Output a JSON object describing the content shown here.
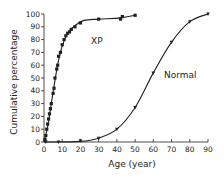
{
  "chart_data": {
    "type": "line",
    "title": "",
    "xlabel": "Age (year)",
    "ylabel": "Cumulative percentage",
    "xlim": [
      0,
      90
    ],
    "ylim": [
      0,
      100
    ],
    "xticks": [
      0,
      10,
      20,
      30,
      40,
      50,
      60,
      70,
      80,
      90
    ],
    "yticks": [
      0,
      10,
      20,
      30,
      40,
      50,
      60,
      70,
      80,
      90,
      100
    ],
    "grid": false,
    "legend": "inline labels",
    "series": [
      {
        "name": "XP",
        "marker": "square",
        "x": [
          0.5,
          1,
          1.5,
          2,
          2.5,
          3,
          3.5,
          4,
          5,
          5.5,
          6,
          7,
          7.5,
          8,
          9,
          10,
          11,
          12,
          13,
          14,
          15,
          17,
          20,
          30,
          42,
          43,
          50
        ],
        "y": [
          2,
          5,
          10,
          14,
          18,
          22,
          26,
          30,
          38,
          42,
          50,
          57,
          60,
          67,
          70,
          76,
          80,
          83,
          85,
          86,
          88,
          90,
          93,
          96,
          96,
          98,
          99
        ]
      },
      {
        "name": "Normal",
        "marker": "triangle",
        "x": [
          1,
          8,
          20,
          30,
          40,
          50,
          60,
          70,
          80,
          90
        ],
        "y": [
          0,
          0,
          1,
          3,
          10,
          27,
          54,
          78,
          94,
          100
        ]
      }
    ],
    "annotations": [
      {
        "text": "XP",
        "x": 20,
        "y": 80
      },
      {
        "text": "Normal",
        "x": 66,
        "y": 62
      }
    ]
  },
  "labels": {
    "xlabel": "Age (year)",
    "ylabel": "Cumulative percentage",
    "xp": "XP",
    "normal": "Normal",
    "yt0": "0",
    "yt10": "10",
    "yt20": "20",
    "yt30": "30",
    "yt40": "40",
    "yt50": "50",
    "yt60": "60",
    "yt70": "70",
    "yt80": "80",
    "yt90": "90",
    "yt100": "100",
    "xt0": "0",
    "xt10": "10",
    "xt20": "20",
    "xt30": "30",
    "xt40": "40",
    "xt50": "50",
    "xt60": "60",
    "xt70": "70",
    "xt80": "80",
    "xt90": "90"
  }
}
